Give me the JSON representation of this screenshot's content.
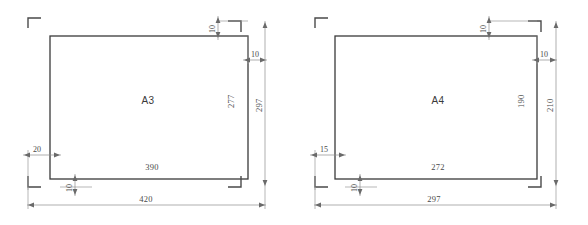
{
  "diagram": {
    "type": "engineering-dimension-drawing",
    "units": "mm",
    "colors": {
      "background": "#ffffff",
      "frame_stroke": "#3a3a3a",
      "dimension_stroke": "#8d8d8d",
      "text": "#4a4a4a"
    },
    "sheets": [
      {
        "id": "a3",
        "label": "A3",
        "outer_width": "420",
        "outer_height": "297",
        "inner_width": "390",
        "inner_height": "277",
        "margin_left": "20",
        "margin_right": "10",
        "margin_top": "10",
        "margin_bottom": "10"
      },
      {
        "id": "a4",
        "label": "A4",
        "outer_width": "297",
        "outer_height": "210",
        "inner_width": "272",
        "inner_height": "190",
        "margin_left": "15",
        "margin_right": "10",
        "margin_top": "10",
        "margin_bottom": "10"
      }
    ]
  }
}
